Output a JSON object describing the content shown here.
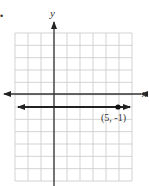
{
  "figure": {
    "bullet": "•",
    "x_axis_label": "x",
    "y_axis_label": "y",
    "point_label": "(5, -1)",
    "colors": {
      "grid": "#c8c8c8",
      "axis": "#333333",
      "line": "#222222",
      "background": "#ffffff"
    }
  },
  "chart_data": {
    "type": "line",
    "title": "",
    "xlabel": "x",
    "ylabel": "y",
    "xlim": [
      -3,
      6
    ],
    "ylim": [
      -7,
      5
    ],
    "grid": true,
    "series": [
      {
        "name": "y = -1",
        "x": [
          -3,
          6
        ],
        "y": [
          -1,
          -1
        ],
        "arrows": "both"
      }
    ],
    "points": [
      {
        "x": 5,
        "y": -1,
        "label": "(5, -1)"
      }
    ],
    "annotations": [
      "(5, -1)"
    ]
  }
}
